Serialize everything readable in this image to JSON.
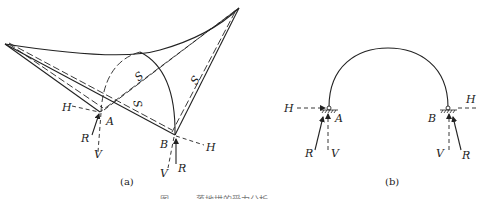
{
  "figure_a": {
    "caption": "(a)",
    "labels": {
      "H_left": "H",
      "A": "A",
      "R_left": "R",
      "V_left": "V",
      "B": "B",
      "H_right": "H",
      "V_right": "V",
      "R_right": "R",
      "S1": "S",
      "S2": "S",
      "S3": "S"
    }
  },
  "figure_b": {
    "caption": "(b)",
    "labels": {
      "H_left": "H",
      "A": "A",
      "R_left": "R",
      "V_left": "V",
      "B": "B",
      "H_right": "H",
      "V_right": "V",
      "R_right": "R"
    }
  },
  "figure_caption": "图 — — 落地拱的受力分析"
}
